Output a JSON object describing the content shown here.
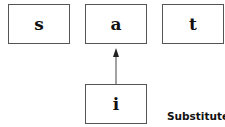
{
  "diagram": {
    "nodes": [
      {
        "id": "s",
        "label": "s"
      },
      {
        "id": "a",
        "label": "a"
      },
      {
        "id": "t",
        "label": "t"
      },
      {
        "id": "i",
        "label": "i"
      }
    ],
    "edges": [
      {
        "from": "i",
        "to": "a"
      }
    ],
    "caption": "Substitute"
  }
}
